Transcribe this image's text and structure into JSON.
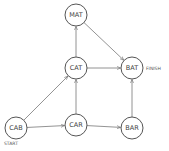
{
  "diagram": {
    "type": "directed-graph",
    "nodes": [
      {
        "id": "MAT",
        "label": "MAT",
        "x": 76,
        "y": 15
      },
      {
        "id": "CAT",
        "label": "CAT",
        "x": 76,
        "y": 68
      },
      {
        "id": "BAT",
        "label": "BAT",
        "x": 132,
        "y": 68
      },
      {
        "id": "CAB",
        "label": "CAB",
        "x": 16,
        "y": 128
      },
      {
        "id": "CAR",
        "label": "CAR",
        "x": 76,
        "y": 125
      },
      {
        "id": "BAR",
        "label": "BAR",
        "x": 132,
        "y": 128
      }
    ],
    "edges": [
      {
        "from": "CAB",
        "to": "CAT"
      },
      {
        "from": "CAB",
        "to": "CAR"
      },
      {
        "from": "CAR",
        "to": "CAT"
      },
      {
        "from": "CAR",
        "to": "BAR"
      },
      {
        "from": "CAT",
        "to": "MAT"
      },
      {
        "from": "CAT",
        "to": "BAT"
      },
      {
        "from": "MAT",
        "to": "BAT"
      },
      {
        "from": "BAR",
        "to": "BAT"
      }
    ],
    "annotations": {
      "start": "START",
      "finish": "FINISH"
    }
  }
}
